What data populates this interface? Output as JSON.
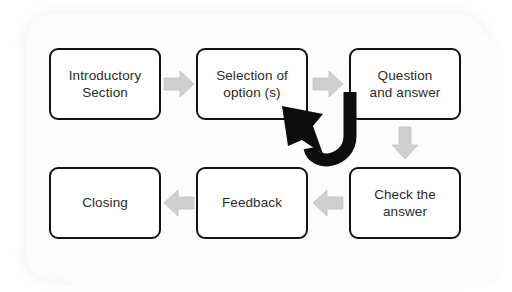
{
  "diagram": {
    "background_color": "#ffffff",
    "panel_color": "#fbfbfb",
    "node_border_color": "#131313",
    "node_fill_color": "#ffffff",
    "node_text_color": "#2b2b2b",
    "flow_arrow_color": "#c9c9c9",
    "feedback_arrow_color": "#0d0d0d",
    "nodes": [
      {
        "id": "intro",
        "label": "Introductory\nSection",
        "row": "top",
        "column": 1
      },
      {
        "id": "selection",
        "label": "Selection of\noption (s)",
        "row": "top",
        "column": 2
      },
      {
        "id": "question",
        "label": "Question\nand answer",
        "row": "top",
        "column": 3
      },
      {
        "id": "check",
        "label": "Check the\nanswer",
        "row": "bottom",
        "column": 3
      },
      {
        "id": "feedback",
        "label": "Feedback",
        "row": "bottom",
        "column": 2
      },
      {
        "id": "closing",
        "label": "Closing",
        "row": "bottom",
        "column": 1
      }
    ],
    "connectors": [
      {
        "id": "intro-selection",
        "from": "intro",
        "to": "selection",
        "direction": "right",
        "style": "gray-block"
      },
      {
        "id": "selection-question",
        "from": "selection",
        "to": "question",
        "direction": "right",
        "style": "gray-block"
      },
      {
        "id": "question-check",
        "from": "question",
        "to": "check",
        "direction": "down",
        "style": "gray-block"
      },
      {
        "id": "check-feedback",
        "from": "check",
        "to": "feedback",
        "direction": "left",
        "style": "gray-block"
      },
      {
        "id": "feedback-closing",
        "from": "feedback",
        "to": "closing",
        "direction": "left",
        "style": "gray-block"
      },
      {
        "id": "question-selection",
        "from": "question",
        "to": "selection",
        "direction": "up-left",
        "style": "black-curved-loop"
      }
    ]
  }
}
